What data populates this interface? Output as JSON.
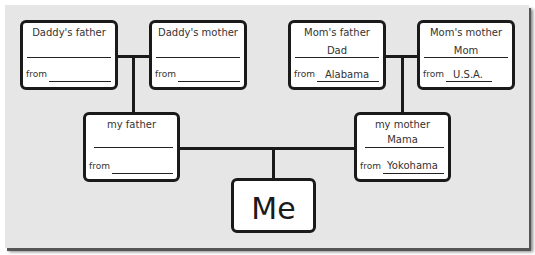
{
  "tree": {
    "daddys_father": {
      "title": "Daddy's father",
      "name": "",
      "from_label": "from",
      "from": ""
    },
    "daddys_mother": {
      "title": "Daddy's mother",
      "name": "",
      "from_label": "from",
      "from": ""
    },
    "moms_father": {
      "title": "Mom's father",
      "name": "Dad",
      "from_label": "from",
      "from": "Alabama"
    },
    "moms_mother": {
      "title": "Mom's mother",
      "name": "Mom",
      "from_label": "from",
      "from": "U.S.A."
    },
    "my_father": {
      "title": "my father",
      "name": "",
      "from_label": "from",
      "from": ""
    },
    "my_mother": {
      "title": "my mother",
      "name": "Mama",
      "from_label": "from",
      "from": "Yokohama"
    },
    "me": {
      "label": "Me"
    }
  }
}
